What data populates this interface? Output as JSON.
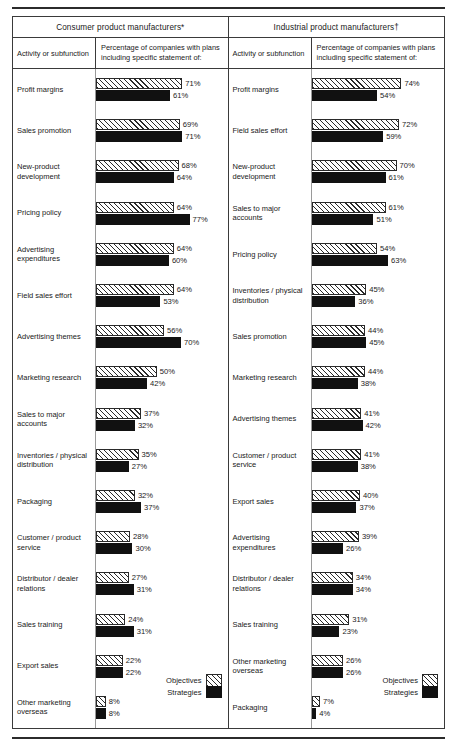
{
  "panels": [
    {
      "id": "consumer",
      "title": "Consumer product manufacturers*",
      "col_activity": "Activity or subfunction",
      "col_percentage": "Percentage of companies with plans including specific statement of:",
      "legend": {
        "objectives": "Objectives",
        "strategies": "Strategies"
      },
      "rows": [
        {
          "label": "Profit margins",
          "objectives": 71,
          "strategies": 61,
          "objectives_label": "71%",
          "strategies_label": "61%"
        },
        {
          "label": "Sales promotion",
          "objectives": 69,
          "strategies": 71,
          "objectives_label": "69%",
          "strategies_label": "71%"
        },
        {
          "label": "New-product development",
          "objectives": 68,
          "strategies": 64,
          "objectives_label": "68%",
          "strategies_label": "64%"
        },
        {
          "label": "Pricing policy",
          "objectives": 64,
          "strategies": 77,
          "objectives_label": "64%",
          "strategies_label": "77%"
        },
        {
          "label": "Advertising expenditures",
          "objectives": 64,
          "strategies": 60,
          "objectives_label": "64%",
          "strategies_label": "60%"
        },
        {
          "label": "Field sales effort",
          "objectives": 64,
          "strategies": 53,
          "objectives_label": "64%",
          "strategies_label": "53%"
        },
        {
          "label": "Advertising themes",
          "objectives": 56,
          "strategies": 70,
          "objectives_label": "56%",
          "strategies_label": "70%"
        },
        {
          "label": "Marketing research",
          "objectives": 50,
          "strategies": 42,
          "objectives_label": "50%",
          "strategies_label": "42%"
        },
        {
          "label": "Sales to major accounts",
          "objectives": 37,
          "strategies": 32,
          "objectives_label": "37%",
          "strategies_label": "32%"
        },
        {
          "label": "Inventories / physical distribution",
          "objectives": 35,
          "strategies": 27,
          "objectives_label": "35%",
          "strategies_label": "27%"
        },
        {
          "label": "Packaging",
          "objectives": 32,
          "strategies": 37,
          "objectives_label": "32%",
          "strategies_label": "37%"
        },
        {
          "label": "Customer / product service",
          "objectives": 28,
          "strategies": 30,
          "objectives_label": "28%",
          "strategies_label": "30%"
        },
        {
          "label": "Distributor / dealer relations",
          "objectives": 27,
          "strategies": 31,
          "objectives_label": "27%",
          "strategies_label": "31%"
        },
        {
          "label": "Sales training",
          "objectives": 24,
          "strategies": 31,
          "objectives_label": "24%",
          "strategies_label": "31%"
        },
        {
          "label": "Export sales",
          "objectives": 22,
          "strategies": 22,
          "objectives_label": "22%",
          "strategies_label": "22%"
        },
        {
          "label": "Other marketing overseas",
          "objectives": 8,
          "strategies": 8,
          "objectives_label": "8%",
          "strategies_label": "8%"
        }
      ]
    },
    {
      "id": "industrial",
      "title": "Industrial product manufacturers†",
      "col_activity": "Activity or subfunction",
      "col_percentage": "Percentage of companies with plans including specific statement of:",
      "legend": {
        "objectives": "Objectives",
        "strategies": "Strategies"
      },
      "rows": [
        {
          "label": "Profit margins",
          "objectives": 74,
          "strategies": 54,
          "objectives_label": "74%",
          "strategies_label": "54%"
        },
        {
          "label": "Field sales effort",
          "objectives": 72,
          "strategies": 59,
          "objectives_label": "72%",
          "strategies_label": "59%"
        },
        {
          "label": "New-product development",
          "objectives": 70,
          "strategies": 61,
          "objectives_label": "70%",
          "strategies_label": "61%"
        },
        {
          "label": "Sales to major accounts",
          "objectives": 61,
          "strategies": 51,
          "objectives_label": "61%",
          "strategies_label": "51%"
        },
        {
          "label": "Pricing policy",
          "objectives": 54,
          "strategies": 63,
          "objectives_label": "54%",
          "strategies_label": "63%"
        },
        {
          "label": "Inventories / physical distribution",
          "objectives": 45,
          "strategies": 36,
          "objectives_label": "45%",
          "strategies_label": "36%"
        },
        {
          "label": "Sales promotion",
          "objectives": 44,
          "strategies": 45,
          "objectives_label": "44%",
          "strategies_label": "45%"
        },
        {
          "label": "Marketing research",
          "objectives": 44,
          "strategies": 38,
          "objectives_label": "44%",
          "strategies_label": "38%"
        },
        {
          "label": "Advertising themes",
          "objectives": 41,
          "strategies": 42,
          "objectives_label": "41%",
          "strategies_label": "42%"
        },
        {
          "label": "Customer / product service",
          "objectives": 41,
          "strategies": 38,
          "objectives_label": "41%",
          "strategies_label": "38%"
        },
        {
          "label": "Export sales",
          "objectives": 40,
          "strategies": 37,
          "objectives_label": "40%",
          "strategies_label": "37%"
        },
        {
          "label": "Advertising expenditures",
          "objectives": 39,
          "strategies": 26,
          "objectives_label": "39%",
          "strategies_label": "26%"
        },
        {
          "label": "Distributor / dealer relations",
          "objectives": 34,
          "strategies": 34,
          "objectives_label": "34%",
          "strategies_label": "34%"
        },
        {
          "label": "Sales training",
          "objectives": 31,
          "strategies": 23,
          "objectives_label": "31%",
          "strategies_label": "23%"
        },
        {
          "label": "Other marketing overseas",
          "objectives": 26,
          "strategies": 26,
          "objectives_label": "26%",
          "strategies_label": "26%"
        },
        {
          "label": "Packaging",
          "objectives": 7,
          "strategies": 4,
          "objectives_label": "7%",
          "strategies_label": "4%"
        }
      ]
    }
  ],
  "chart_data": {
    "type": "bar",
    "orientation": "horizontal",
    "xlabel": "Percentage of companies",
    "ylabel": "Activity or subfunction",
    "xlim": [
      0,
      100
    ],
    "grid": false,
    "legend_position": "bottom-right",
    "legend": [
      "Objectives",
      "Strategies"
    ],
    "footnote_markers": [
      "*",
      "†"
    ],
    "panels": [
      {
        "name": "Consumer product manufacturers*",
        "categories": [
          "Profit margins",
          "Sales promotion",
          "New-product development",
          "Pricing policy",
          "Advertising expenditures",
          "Field sales effort",
          "Advertising themes",
          "Marketing research",
          "Sales to major accounts",
          "Inventories / physical distribution",
          "Packaging",
          "Customer / product service",
          "Distributor / dealer relations",
          "Sales training",
          "Export sales",
          "Other marketing overseas"
        ],
        "series": [
          {
            "name": "Objectives",
            "values": [
              71,
              69,
              68,
              64,
              64,
              64,
              56,
              50,
              37,
              35,
              32,
              28,
              27,
              24,
              22,
              8
            ]
          },
          {
            "name": "Strategies",
            "values": [
              61,
              71,
              64,
              77,
              60,
              53,
              70,
              42,
              32,
              27,
              37,
              30,
              31,
              31,
              22,
              8
            ]
          }
        ]
      },
      {
        "name": "Industrial product manufacturers†",
        "categories": [
          "Profit margins",
          "Field sales effort",
          "New-product development",
          "Sales to major accounts",
          "Pricing policy",
          "Inventories / physical distribution",
          "Sales promotion",
          "Marketing research",
          "Advertising themes",
          "Customer / product service",
          "Export sales",
          "Advertising expenditures",
          "Distributor / dealer relations",
          "Sales training",
          "Other marketing overseas",
          "Packaging"
        ],
        "series": [
          {
            "name": "Objectives",
            "values": [
              74,
              72,
              70,
              61,
              54,
              45,
              44,
              44,
              41,
              41,
              40,
              39,
              34,
              31,
              26,
              7
            ]
          },
          {
            "name": "Strategies",
            "values": [
              54,
              59,
              61,
              51,
              63,
              36,
              45,
              38,
              42,
              38,
              37,
              26,
              34,
              23,
              26,
              4
            ]
          }
        ]
      }
    ]
  }
}
